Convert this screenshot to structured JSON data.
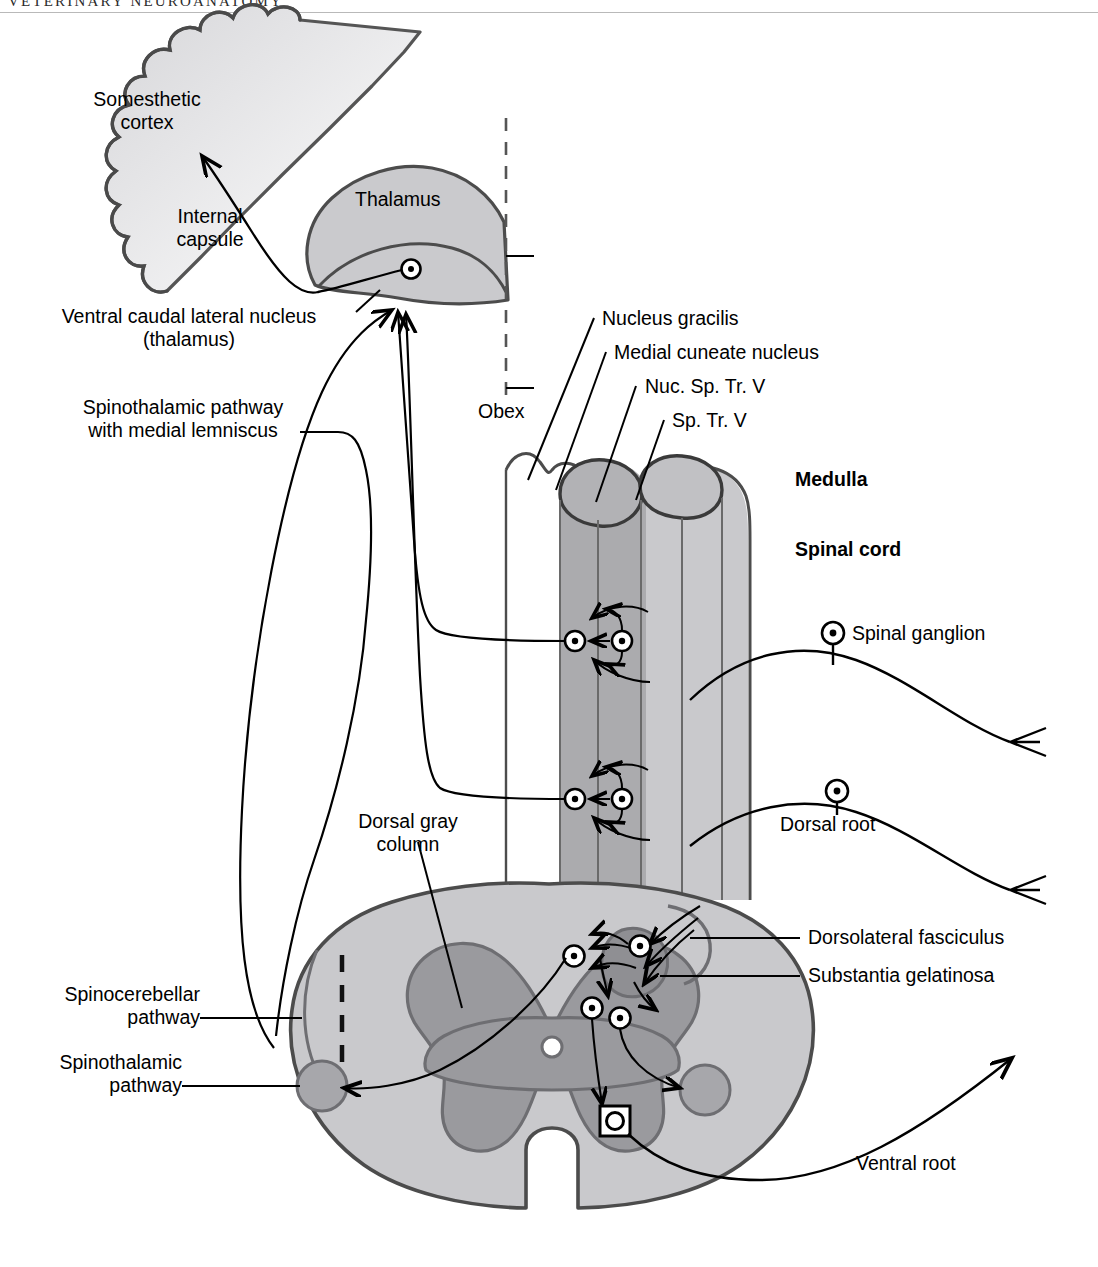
{
  "page": {
    "running_head": "VETERINARY NEUROANATOMY",
    "width": 1098,
    "height": 1267
  },
  "figure": {
    "type": "anatomical-diagram",
    "colors": {
      "white_matter": "#c9c9cc",
      "gray_matter": "#9a9a9e",
      "outline": "#4c4c4c",
      "stroke": "#000000",
      "background": "#ffffff"
    }
  },
  "labels": {
    "somesthetic_cortex": "Somesthetic\ncortex",
    "internal_capsule": "Internal\ncapsule",
    "thalamus": "Thalamus",
    "ventral_caudal_lateral_nucleus": "Ventral caudal lateral nucleus\n(thalamus)",
    "spinothalamic_with_medial_lemniscus": "Spinothalamic pathway\nwith medial lemniscus",
    "obex": "Obex",
    "nucleus_gracilis": "Nucleus gracilis",
    "medial_cuneate_nucleus": "Medial cuneate nucleus",
    "nuc_sp_tr_v": "Nuc. Sp. Tr. V",
    "sp_tr_v": "Sp. Tr. V",
    "medulla": "Medulla",
    "spinal_cord": "Spinal cord",
    "spinal_ganglion": "Spinal ganglion",
    "dorsal_root": "Dorsal root",
    "dorsal_gray_column": "Dorsal gray\ncolumn",
    "dorsolateral_fasciculus": "Dorsolateral fasciculus",
    "substantia_gelatinosa": "Substantia gelatinosa",
    "spinocerebellar_pathway": "Spinocerebellar\npathway",
    "spinothalamic_pathway": "Spinothalamic\npathway",
    "ventral_root": "Ventral root"
  },
  "structures": [
    {
      "name": "somesthetic-cortex",
      "kind": "cerebral-cortex-gyri"
    },
    {
      "name": "thalamus",
      "kind": "nucleus-mass"
    },
    {
      "name": "medulla-columns",
      "kind": "brainstem-columns"
    },
    {
      "name": "spinal-cord-cross-section",
      "kind": "cross-section"
    }
  ],
  "symbols": {
    "neuron_soma": "circle-with-dot",
    "motor_neuron_soma": "square-with-circle",
    "sensory_ending": "forked-terminal",
    "midline": "dashed-vertical-line"
  }
}
